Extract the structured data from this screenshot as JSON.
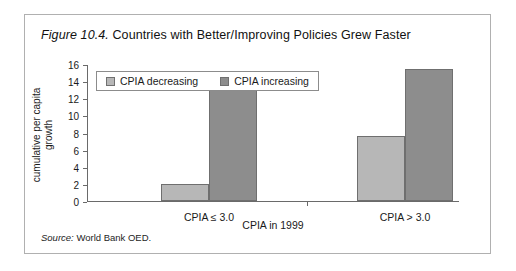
{
  "figure": {
    "number": "Figure 10.4.",
    "title": " Countries with Better/Improving Policies Grew Faster",
    "source_label": "Source:",
    "source_text": " World Bank OED."
  },
  "colors": {
    "decreasing": "#b7b7b7",
    "increasing": "#8d8d8d",
    "axis": "#6a6a6a",
    "frame": "#b0b0b0"
  },
  "chart_data": {
    "type": "bar",
    "title": "Countries with Better/Improving Policies Grew Faster",
    "categories": [
      "CPIA ≤ 3.0",
      "CPIA > 3.0"
    ],
    "series": [
      {
        "name": "CPIA decreasing",
        "values": [
          2.0,
          7.6
        ],
        "color": "#b7b7b7"
      },
      {
        "name": "CPIA  increasing",
        "values": [
          13.8,
          15.4
        ],
        "color": "#8d8d8d"
      }
    ],
    "xlabel": "CPIA in 1999",
    "ylabel": "cumulative per capita growth",
    "ylim": [
      0,
      16
    ],
    "yticks": [
      0,
      2,
      4,
      6,
      8,
      10,
      12,
      14,
      16
    ],
    "ytick_labels": [
      "0",
      "2",
      "4",
      "6",
      "8",
      "10",
      "12",
      "14",
      "16"
    ],
    "grid": false,
    "legend_position": "top-left",
    "source": "World Bank OED."
  }
}
